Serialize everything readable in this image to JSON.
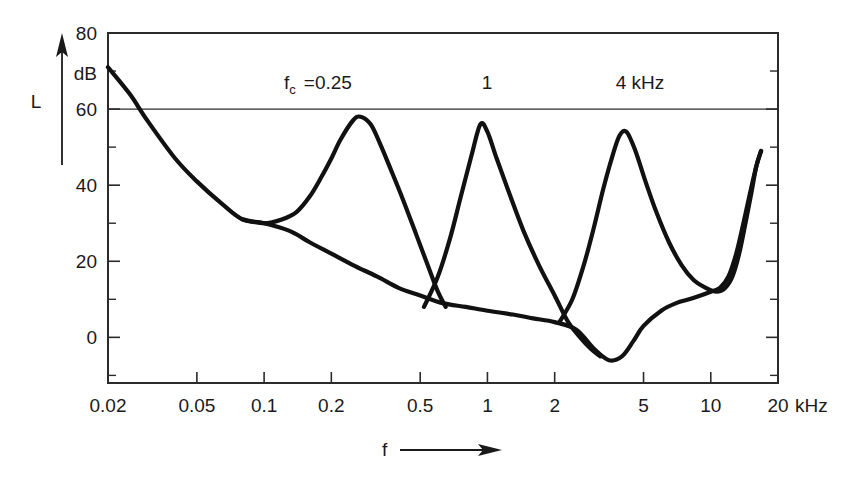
{
  "figure": {
    "background_color": "#ffffff",
    "curve_color": "#111111",
    "axis_color": "#2b2b2b"
  },
  "axes": {
    "y": {
      "title": "L",
      "unit": "dB",
      "ticks": [
        "0",
        "20",
        "40",
        "60",
        "80"
      ],
      "tick_values": [
        0,
        20,
        40,
        60,
        80
      ],
      "minor_tick_values": [
        -10,
        10,
        30,
        50,
        70
      ],
      "range": [
        -12,
        80
      ],
      "arrow_direction": "up"
    },
    "x": {
      "title": "f",
      "unit": "kHz",
      "ticks": [
        "0.02",
        "0.05",
        "0.1",
        "0.2",
        "0.5",
        "1",
        "2",
        "5",
        "10",
        "20"
      ],
      "tick_values": [
        0.02,
        0.05,
        0.1,
        0.2,
        0.5,
        1,
        2,
        5,
        10,
        20
      ],
      "range": [
        0.02,
        20
      ],
      "scale": "log",
      "arrow_direction": "right"
    }
  },
  "annotations": {
    "masker_prefix": "f",
    "masker_subscript": "c",
    "masker_equals": "=0.25",
    "masker_second": "1",
    "masker_third": "4 kHz",
    "reference_level_db": 60
  },
  "chart_data": {
    "type": "line",
    "title": "",
    "xlabel": "f",
    "ylabel": "L",
    "xunit": "kHz",
    "yunit": "dB",
    "xscale": "log",
    "xlim": [
      0.02,
      20
    ],
    "ylim": [
      -12,
      80
    ],
    "grid": false,
    "legend": "none",
    "reference_lines": [
      {
        "name": "masker-level-60db",
        "orientation": "horizontal",
        "value": 60
      }
    ],
    "series": [
      {
        "name": "threshold-in-quiet",
        "label": "Threshold in quiet",
        "points": [
          [
            0.02,
            71
          ],
          [
            0.025,
            64
          ],
          [
            0.03,
            57
          ],
          [
            0.04,
            47
          ],
          [
            0.05,
            41
          ],
          [
            0.065,
            35
          ],
          [
            0.08,
            31
          ],
          [
            0.1,
            30
          ],
          [
            0.13,
            28
          ],
          [
            0.16,
            25
          ],
          [
            0.2,
            22
          ],
          [
            0.25,
            19
          ],
          [
            0.32,
            16
          ],
          [
            0.4,
            13
          ],
          [
            0.5,
            11
          ],
          [
            0.63,
            9
          ],
          [
            0.8,
            8
          ],
          [
            1.0,
            7
          ],
          [
            1.3,
            6
          ],
          [
            1.6,
            5
          ],
          [
            2.0,
            4
          ],
          [
            2.5,
            2
          ],
          [
            3.0,
            -3
          ],
          [
            3.5,
            -6
          ],
          [
            4.0,
            -5
          ],
          [
            4.5,
            -1
          ],
          [
            5.0,
            3
          ],
          [
            6.0,
            7
          ],
          [
            7.0,
            9
          ],
          [
            8.0,
            10
          ],
          [
            9.0,
            11
          ],
          [
            10.0,
            12
          ],
          [
            11.0,
            13
          ],
          [
            12.0,
            16
          ],
          [
            13.0,
            22
          ],
          [
            14.0,
            30
          ],
          [
            15.0,
            38
          ],
          [
            16.0,
            45
          ],
          [
            16.8,
            49
          ]
        ]
      },
      {
        "name": "masking-threshold-fc-0p25",
        "label": "Masking threshold, fc = 0.25 kHz",
        "peak_frequency_khz": 0.26,
        "peak_level_db": 58,
        "points": [
          [
            0.08,
            31
          ],
          [
            0.1,
            30
          ],
          [
            0.12,
            31
          ],
          [
            0.14,
            33
          ],
          [
            0.16,
            37
          ],
          [
            0.18,
            42
          ],
          [
            0.2,
            47
          ],
          [
            0.22,
            52
          ],
          [
            0.25,
            57
          ],
          [
            0.27,
            58
          ],
          [
            0.3,
            56
          ],
          [
            0.33,
            51
          ],
          [
            0.37,
            44
          ],
          [
            0.42,
            36
          ],
          [
            0.48,
            27
          ],
          [
            0.54,
            19
          ],
          [
            0.6,
            12
          ],
          [
            0.65,
            8
          ]
        ]
      },
      {
        "name": "masking-threshold-fc-1",
        "label": "Masking threshold, fc = 1 kHz",
        "peak_frequency_khz": 0.95,
        "peak_level_db": 56,
        "points": [
          [
            0.52,
            8
          ],
          [
            0.6,
            16
          ],
          [
            0.68,
            26
          ],
          [
            0.76,
            37
          ],
          [
            0.85,
            48
          ],
          [
            0.93,
            56
          ],
          [
            1.0,
            54
          ],
          [
            1.1,
            47
          ],
          [
            1.25,
            38
          ],
          [
            1.45,
            28
          ],
          [
            1.7,
            19
          ],
          [
            2.0,
            11
          ],
          [
            2.3,
            4
          ],
          [
            2.6,
            0
          ],
          [
            2.9,
            -3
          ],
          [
            3.2,
            -5
          ]
        ]
      },
      {
        "name": "masking-threshold-fc-4",
        "label": "Masking threshold, fc = 4 kHz",
        "peak_frequency_khz": 4.1,
        "peak_level_db": 54,
        "points": [
          [
            2.1,
            4
          ],
          [
            2.4,
            10
          ],
          [
            2.7,
            19
          ],
          [
            3.0,
            29
          ],
          [
            3.3,
            39
          ],
          [
            3.6,
            47
          ],
          [
            3.9,
            53
          ],
          [
            4.2,
            54
          ],
          [
            4.6,
            49
          ],
          [
            5.1,
            41
          ],
          [
            5.7,
            33
          ],
          [
            6.5,
            25
          ],
          [
            7.4,
            19
          ],
          [
            8.4,
            15
          ],
          [
            9.5,
            13
          ],
          [
            10.6,
            12
          ],
          [
            11.6,
            13
          ],
          [
            12.5,
            16
          ],
          [
            13.4,
            22
          ],
          [
            14.3,
            30
          ],
          [
            15.2,
            38
          ],
          [
            16.0,
            45
          ],
          [
            16.8,
            49
          ]
        ]
      }
    ]
  }
}
